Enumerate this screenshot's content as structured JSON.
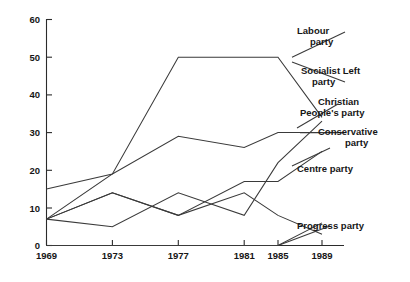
{
  "chart_data": {
    "type": "line",
    "title": "",
    "subtitle": "",
    "xlabel": "",
    "ylabel": "",
    "x": [
      1969,
      1973,
      1977,
      1981,
      1985,
      1989
    ],
    "xtick_labels": [
      "1969",
      "1973",
      "1977",
      "1981",
      "1985",
      "1989"
    ],
    "ytick_labels": [
      "0",
      "10",
      "20",
      "30",
      "40",
      "50",
      "60"
    ],
    "yticks": [
      0,
      10,
      20,
      30,
      40,
      50,
      60
    ],
    "xlim": [
      1969,
      1989
    ],
    "ylim": [
      0,
      60
    ],
    "grid": false,
    "legend_position": "right-inline-labels",
    "series": [
      {
        "name": "Labour party",
        "label": "Labour party",
        "label_line1": "Labour",
        "label_line2": "party",
        "values": [
          7,
          19,
          50,
          50,
          50,
          34
        ]
      },
      {
        "name": "Socialist Left party",
        "label": "Socialist Left party",
        "label_line1": "Socialist Left",
        "label_line2": "party",
        "values": [
          7,
          14,
          8,
          14,
          8,
          3
        ]
      },
      {
        "name": "Christian People's party",
        "label": "Christian People's party",
        "label_line1": "Christian",
        "label_line2": "People's party",
        "values": [
          7,
          5,
          14,
          8,
          22,
          33
        ]
      },
      {
        "name": "Conservative party",
        "label": "Conservative party",
        "label_line1": "Conservative",
        "label_line2": "party",
        "values": [
          15,
          19,
          29,
          26,
          30,
          30
        ]
      },
      {
        "name": "Centre party",
        "label": "Centre party",
        "label_line1": "Centre party",
        "label_line2": "",
        "values": [
          7,
          14,
          8,
          17,
          17,
          25
        ]
      },
      {
        "name": "Progress party",
        "label": "Progress party",
        "label_line1": "Progress party",
        "label_line2": "",
        "values": [
          0,
          0,
          0,
          0,
          0,
          6
        ]
      }
    ]
  },
  "axes": {
    "y_ticks": [
      "60",
      "50",
      "40",
      "30",
      "20",
      "10",
      "0"
    ],
    "x_ticks": [
      "1969",
      "1973",
      "1977",
      "1981",
      "1985",
      "1989"
    ]
  },
  "legend": {
    "items": [
      {
        "line1": "Labour",
        "line2": "party"
      },
      {
        "line1": "Socialist Left",
        "line2": "party"
      },
      {
        "line1": "Christian",
        "line2": "People's party"
      },
      {
        "line1": "Conservative",
        "line2": "party"
      },
      {
        "line1": "Centre party",
        "line2": ""
      },
      {
        "line1": "Progress party",
        "line2": ""
      }
    ]
  },
  "colors": {
    "ink": "#2b2b2b",
    "background": "#ffffff"
  }
}
